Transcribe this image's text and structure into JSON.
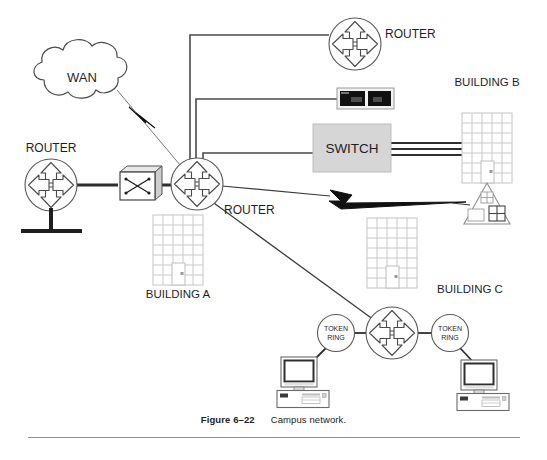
{
  "figure": {
    "number_label": "Figure 6–22",
    "caption": "Campus network.",
    "title": "Campus network"
  },
  "labels": {
    "wan": "WAN",
    "router_left": "ROUTER",
    "router_center": "ROUTER",
    "router_top": "ROUTER",
    "switch": "SWITCH",
    "building_a": "BUILDING A",
    "building_b": "BUILDING B",
    "building_c": "BUILDING C",
    "token_ring_left": "TOKEN RING",
    "token_ring_left_line1": "TOKEN",
    "token_ring_left_line2": "RING",
    "token_ring_right": "TOKEN RING",
    "token_ring_right_line1": "TOKEN",
    "token_ring_right_line2": "RING"
  },
  "colors": {
    "stroke": "#3b3b3b",
    "line": "#4a4a4a",
    "building_grid": "#c9c9c9",
    "switch_fill": "#d6d6d6",
    "switch_stroke": "#a8a8a8",
    "device_black": "#111111",
    "text": "#1f1f1f",
    "rule": "#8d939b",
    "background": "#ffffff"
  },
  "diagram": {
    "type": "network-topology",
    "nodes": [
      {
        "id": "wan",
        "kind": "cloud",
        "label": "WAN",
        "x": 82,
        "y": 78
      },
      {
        "id": "router-left",
        "kind": "router",
        "label": "ROUTER",
        "x": 51,
        "y": 185
      },
      {
        "id": "csu-dsu",
        "kind": "crossconnect-box",
        "label": "",
        "x": 139,
        "y": 184
      },
      {
        "id": "router-center",
        "kind": "router",
        "label": "ROUTER",
        "x": 197,
        "y": 184
      },
      {
        "id": "router-top",
        "kind": "router",
        "label": "ROUTER",
        "x": 355,
        "y": 44
      },
      {
        "id": "modem",
        "kind": "black-device",
        "label": "",
        "x": 365,
        "y": 98
      },
      {
        "id": "switch",
        "kind": "switch-box",
        "label": "SWITCH",
        "x": 352,
        "y": 148
      },
      {
        "id": "building-a",
        "kind": "building",
        "label": "BUILDING A",
        "x": 178,
        "y": 250
      },
      {
        "id": "building-b",
        "kind": "building",
        "label": "BUILDING B",
        "x": 487,
        "y": 148
      },
      {
        "id": "building-c",
        "kind": "building",
        "label": "BUILDING C",
        "x": 392,
        "y": 253
      },
      {
        "id": "remote-site",
        "kind": "triangle-building",
        "label": "",
        "x": 487,
        "y": 205
      },
      {
        "id": "router-bottom",
        "kind": "router",
        "label": "",
        "x": 392,
        "y": 333
      },
      {
        "id": "token-ring-left",
        "kind": "token-ring",
        "label": "TOKEN RING",
        "x": 336,
        "y": 333
      },
      {
        "id": "token-ring-right",
        "kind": "token-ring",
        "label": "TOKEN RING",
        "x": 450,
        "y": 333
      },
      {
        "id": "workstation-left",
        "kind": "workstation",
        "label": "",
        "x": 303,
        "y": 380
      },
      {
        "id": "workstation-right",
        "kind": "workstation",
        "label": "",
        "x": 483,
        "y": 383
      }
    ],
    "links": [
      {
        "from": "wan",
        "to": "router-center",
        "style": "lightning"
      },
      {
        "from": "router-left",
        "to": "csu-dsu",
        "style": "thick"
      },
      {
        "from": "csu-dsu",
        "to": "router-center",
        "style": "thick"
      },
      {
        "from": "router-center",
        "to": "router-top",
        "style": "elbow"
      },
      {
        "from": "router-center",
        "to": "modem",
        "style": "elbow"
      },
      {
        "from": "router-center",
        "to": "switch",
        "style": "elbow"
      },
      {
        "from": "switch",
        "to": "building-b",
        "style": "triple"
      },
      {
        "from": "router-center",
        "to": "remote-site",
        "style": "lightning"
      },
      {
        "from": "router-center",
        "to": "router-bottom",
        "style": "plain"
      },
      {
        "from": "router-bottom",
        "to": "token-ring-left",
        "style": "plain"
      },
      {
        "from": "router-bottom",
        "to": "token-ring-right",
        "style": "plain"
      },
      {
        "from": "token-ring-left",
        "to": "workstation-left",
        "style": "plain"
      },
      {
        "from": "token-ring-right",
        "to": "workstation-right",
        "style": "plain"
      }
    ]
  }
}
